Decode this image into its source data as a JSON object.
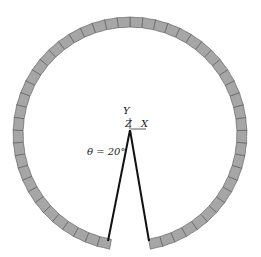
{
  "diagram": {
    "type": "segmented-ring-with-opening",
    "ring": {
      "center": [
        130,
        134
      ],
      "outer_radius": 117,
      "inner_radius": 107,
      "fill_color": "#a6a6a6",
      "stroke_color": "#555555",
      "segment_count": 54,
      "gap_half_angle_deg": 10
    },
    "opening_lines": {
      "apex": [
        130,
        130
      ],
      "left_end": [
        108,
        241
      ],
      "right_end": [
        149,
        241
      ],
      "color": "#111111"
    },
    "axes": {
      "y_label": "Y",
      "z_label": "Z",
      "x_label": "X"
    },
    "angle_label": "θ = 20°"
  }
}
